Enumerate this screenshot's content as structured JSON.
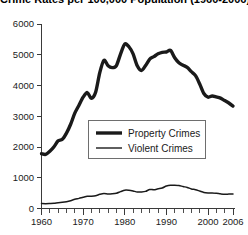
{
  "chart_data": {
    "type": "line",
    "title": "Crime Rates per 100,000 Population (1960-2006)",
    "xlabel": "",
    "ylabel": "",
    "xlim": [
      1960,
      2006
    ],
    "ylim": [
      0,
      6000
    ],
    "grid": false,
    "legend_position": "center",
    "y_ticks": [
      0,
      1000,
      2000,
      3000,
      4000,
      5000,
      6000
    ],
    "y_tick_labels": [
      "0",
      "1000",
      "2000",
      "3000",
      "4000",
      "5000",
      "6000"
    ],
    "x_ticks": [
      1960,
      1970,
      1980,
      1990,
      2000,
      2006
    ],
    "x_tick_labels": [
      "1960",
      "1970",
      "1980",
      "1990",
      "2000",
      "2006"
    ],
    "x_minor_tick_interval": 2,
    "x": [
      1960,
      1961,
      1962,
      1963,
      1964,
      1965,
      1966,
      1967,
      1968,
      1969,
      1970,
      1971,
      1972,
      1973,
      1974,
      1975,
      1976,
      1977,
      1978,
      1979,
      1980,
      1981,
      1982,
      1983,
      1984,
      1985,
      1986,
      1987,
      1988,
      1989,
      1990,
      1991,
      1992,
      1993,
      1994,
      1995,
      1996,
      1997,
      1998,
      1999,
      2000,
      2001,
      2002,
      2003,
      2004,
      2005,
      2006
    ],
    "series": [
      {
        "name": "Property Crimes",
        "style": "thick",
        "color": "#1a1a1a",
        "values": [
          1780,
          1760,
          1860,
          2010,
          2200,
          2250,
          2450,
          2740,
          3100,
          3360,
          3620,
          3770,
          3580,
          3780,
          4420,
          4820,
          4640,
          4580,
          4650,
          5030,
          5350,
          5260,
          5030,
          4640,
          4490,
          4650,
          4860,
          4940,
          5030,
          5080,
          5090,
          5140,
          4900,
          4740,
          4660,
          4590,
          4450,
          4320,
          4050,
          3740,
          3620,
          3660,
          3630,
          3590,
          3510,
          3430,
          3330
        ]
      },
      {
        "name": "Violent Crimes",
        "style": "thin",
        "color": "#1a1a1a",
        "values": [
          160,
          158,
          162,
          168,
          190,
          200,
          220,
          253,
          298,
          329,
          364,
          396,
          401,
          417,
          461,
          488,
          468,
          476,
          498,
          549,
          597,
          594,
          571,
          538,
          539,
          557,
          620,
          610,
          640,
          666,
          730,
          758,
          758,
          748,
          714,
          685,
          637,
          611,
          568,
          523,
          506,
          505,
          494,
          476,
          463,
          469,
          474
        ]
      }
    ]
  },
  "legend": {
    "items": [
      {
        "label": "Property Crimes"
      },
      {
        "label": "Violent Crimes"
      }
    ]
  },
  "colors": {
    "axis": "#3a3a3a",
    "text": "#1a1a1a",
    "line": "#1a1a1a",
    "background": "#ffffff",
    "legend_border": "#6e6e6e"
  }
}
